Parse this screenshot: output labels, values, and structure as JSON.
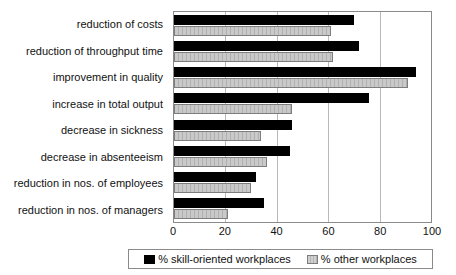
{
  "chart_data": {
    "type": "bar",
    "orientation": "horizontal",
    "title": "",
    "subtitle": "",
    "xlabel": "",
    "ylabel": "",
    "xlim": [
      0,
      100
    ],
    "xticks": [
      0,
      20,
      40,
      60,
      80,
      100
    ],
    "grid": true,
    "legend_position": "bottom",
    "categories": [
      "reduction of costs",
      "reduction of throughput time",
      "improvement in quality",
      "increase in total output",
      "decrease in sickness",
      "decrease in absenteeism",
      "reduction in nos. of employees",
      "reduction in nos. of managers"
    ],
    "series": [
      {
        "name": "% skill-oriented workplaces",
        "color": "#000000",
        "values": [
          70,
          72,
          94,
          76,
          46,
          45,
          32,
          35
        ]
      },
      {
        "name": "% other workplaces",
        "color": "#c9c9c9",
        "values": [
          61,
          62,
          91,
          46,
          34,
          36,
          30,
          21
        ]
      }
    ]
  },
  "legend": {
    "entries": [
      {
        "label": "% skill-oriented workplaces",
        "swatch": "black-square-icon"
      },
      {
        "label": "% other workplaces",
        "swatch": "gray-hatched-square-icon"
      }
    ]
  }
}
